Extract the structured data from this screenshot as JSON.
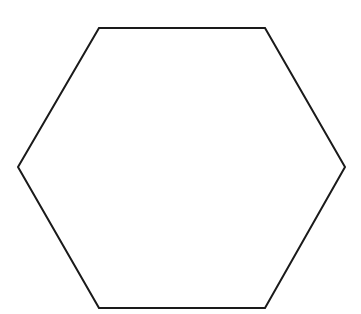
{
  "diagram": {
    "width": 361,
    "height": 314,
    "background": "#ffffff",
    "shapes": [
      {
        "type": "hexagon",
        "fill": "none",
        "stroke": "#1a1a1a",
        "stroke_width": 2,
        "points": [
          [
            99,
            28
          ],
          [
            265,
            28
          ],
          [
            345,
            167
          ],
          [
            265,
            308
          ],
          [
            99,
            308
          ],
          [
            18,
            167
          ]
        ]
      }
    ]
  }
}
